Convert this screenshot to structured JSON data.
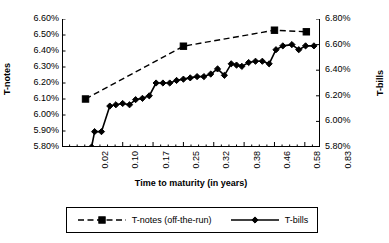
{
  "chart_data": {
    "type": "line",
    "title": "",
    "xlabel": "Time to maturity (in years)",
    "ylabel": "T-notes",
    "y2label": "T-bills",
    "grid": false,
    "legend_position": "bottom",
    "xlim": [
      0,
      34
    ],
    "x_tick_labels": [
      "0.02",
      "0.10",
      "0.17",
      "0.25",
      "0.32",
      "0.38",
      "0.46",
      "0.58",
      "0.83"
    ],
    "x_tick_positions": [
      0,
      4,
      8,
      12,
      16,
      20,
      24,
      28,
      32
    ],
    "x_minor_ticks": true,
    "ylim": [
      5.8,
      6.6
    ],
    "y_tick_labels": [
      "5.80%",
      "5.90%",
      "6.00%",
      "6.10%",
      "6.20%",
      "6.30%",
      "6.40%",
      "6.50%",
      "6.60%"
    ],
    "y_tick_values": [
      5.8,
      5.9,
      6.0,
      6.1,
      6.2,
      6.3,
      6.4,
      6.5,
      6.6
    ],
    "y2lim": [
      5.8,
      6.8
    ],
    "y2_tick_labels": [
      "5.80%",
      "6.00%",
      "6.20%",
      "6.40%",
      "6.60%",
      "6.80%"
    ],
    "y2_tick_values": [
      5.8,
      6.0,
      6.2,
      6.4,
      6.6,
      6.8
    ],
    "series": [
      {
        "name": "T-notes (off-the-run)",
        "axis": "left",
        "marker": "square",
        "linestyle": "dashed",
        "color": "#000000",
        "x": [
          3.1,
          16.0,
          28.0,
          32.2
        ],
        "values": [
          6.1,
          6.43,
          6.53,
          6.52
        ]
      },
      {
        "name": "T-bills",
        "axis": "right",
        "marker": "diamond",
        "linestyle": "solid",
        "color": "#000000",
        "x": [
          3.9,
          4.3,
          5.2,
          6.3,
          7.1,
          8.0,
          8.9,
          9.7,
          10.6,
          11.5,
          12.4,
          13.3,
          14.2,
          15.1,
          16.0,
          16.9,
          17.8,
          18.7,
          19.6,
          20.5,
          21.4,
          22.3,
          23.0,
          23.7,
          24.6,
          25.5,
          26.4,
          27.3,
          28.2,
          29.1,
          30.3,
          31.2,
          32.1,
          33.2
        ],
        "values": [
          5.8,
          5.92,
          5.92,
          6.12,
          6.13,
          6.14,
          6.13,
          6.17,
          6.18,
          6.2,
          6.3,
          6.3,
          6.3,
          6.32,
          6.33,
          6.34,
          6.35,
          6.35,
          6.37,
          6.41,
          6.36,
          6.45,
          6.44,
          6.43,
          6.46,
          6.47,
          6.47,
          6.45,
          6.56,
          6.59,
          6.6,
          6.56,
          6.59,
          6.59
        ]
      }
    ]
  },
  "legend": {
    "entries": [
      {
        "label": "T-notes (off-the-run)",
        "marker": "square",
        "linestyle": "dashed"
      },
      {
        "label": "T-bills",
        "marker": "diamond",
        "linestyle": "solid"
      }
    ]
  }
}
